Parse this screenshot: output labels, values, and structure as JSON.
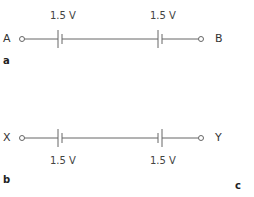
{
  "diagrams": [
    {
      "panel": "a",
      "left_terminal": "A",
      "right_terminal": "B",
      "cells": [
        {
          "label": "1.5 V",
          "orientation": "long-left"
        },
        {
          "label": "1.5 V",
          "orientation": "long-left"
        }
      ],
      "label_position": "above"
    },
    {
      "panel": "b",
      "left_terminal": "X",
      "right_terminal": "Y",
      "cells": [
        {
          "label": "1.5 V",
          "orientation": "long-left"
        },
        {
          "label": "1.5 V",
          "orientation": "long-right"
        }
      ],
      "label_position": "below"
    }
  ],
  "extra_panel_label": "c",
  "colors": {
    "wire": "#555555",
    "text": "#333333"
  }
}
